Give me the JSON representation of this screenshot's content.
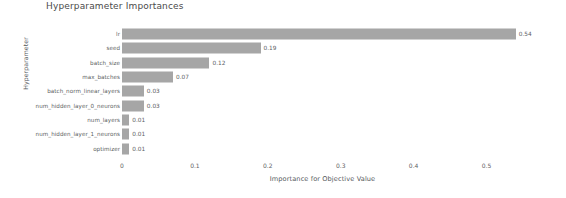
{
  "chart_data": {
    "type": "bar",
    "orientation": "horizontal",
    "title": "Hyperparameter Importances",
    "xlabel": "Importance for Objective Value",
    "ylabel": "Hyperparameter",
    "xlim": [
      0,
      0.55
    ],
    "xticks": [
      0,
      0.1,
      0.2,
      0.3,
      0.4,
      0.5
    ],
    "xtick_labels": [
      "0",
      "0.1",
      "0.2",
      "0.3",
      "0.4",
      "0.5"
    ],
    "grid": false,
    "legend": null,
    "bar_color": "#a6a6a6",
    "categories": [
      "lr",
      "seed",
      "batch_size",
      "max_batches",
      "batch_norm_linear_layers",
      "num_hidden_layer_0_neurons",
      "num_layers",
      "num_hidden_layer_1_neurons",
      "optimizer"
    ],
    "values": [
      0.54,
      0.19,
      0.12,
      0.07,
      0.03,
      0.03,
      0.01,
      0.01,
      0.01
    ],
    "value_labels": [
      "0.54",
      "0.19",
      "0.12",
      "0.07",
      "0.03",
      "0.03",
      "0.01",
      "0.01",
      "0.01"
    ]
  }
}
